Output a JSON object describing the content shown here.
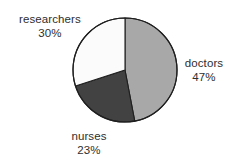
{
  "chart_data": {
    "type": "pie",
    "title": "",
    "categories": [
      "doctors",
      "nurses",
      "researchers"
    ],
    "values": [
      47,
      23,
      30
    ],
    "value_unit": "%",
    "labels": [
      {
        "name": "doctors",
        "value": "47%",
        "percent": 47,
        "color": "#a8a8a8",
        "position": "right"
      },
      {
        "name": "nurses",
        "value": "23%",
        "percent": 23,
        "color": "#424242",
        "position": "bottom-left"
      },
      {
        "name": "researchers",
        "value": "30%",
        "percent": 30,
        "color": "#fbfbfb",
        "position": "top-left"
      }
    ],
    "start_angle_deg": 0,
    "direction": "clockwise",
    "legend": "none",
    "grid": false,
    "outline_color": "#1f1f1f",
    "background": "#ffffff",
    "text_color": "#2e2e2e"
  },
  "slices": {
    "doctors": {
      "name": "doctors",
      "value": "47%"
    },
    "nurses": {
      "name": "nurses",
      "value": "23%"
    },
    "researchers": {
      "name": "researchers",
      "value": "30%"
    }
  }
}
